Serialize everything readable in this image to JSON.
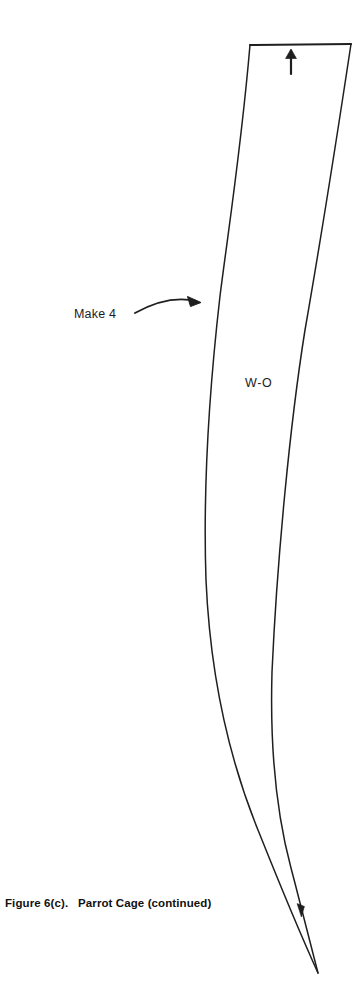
{
  "page": {
    "width": 361,
    "height": 1008,
    "background_color": "#ffffff",
    "ink_color": "#1f1f1f"
  },
  "figure": {
    "caption": "Figure 6(c).   Parrot Cage (continued)",
    "caption_bold": true,
    "piece_label": "W-O",
    "quantity_note": "Make 4",
    "grainline_icon": "up-arrow-icon",
    "direction_marker_icon": "arrowhead-icon",
    "pointer_icon": "curved-arrow-icon"
  },
  "geometry": {
    "top_edge": {
      "x1": 250,
      "y1": 45,
      "x2": 351,
      "y2": 44
    },
    "tip": {
      "x": 318,
      "y": 973
    },
    "grain_arrow": {
      "x": 291,
      "y": 62
    },
    "inner_marker": {
      "x": 300,
      "y": 910
    },
    "outer_path": "M 250 45 C 241 150 229 225 220 296 C 209 392 203 492 206 580 C 210 672 228 756 258 830 C 282 890 303 940 318 973",
    "inner_path": "M 351 44 C 338 130 320 244 305 330 C 290 424 277 560 272 672 C 270 742 276 812 291 868 C 301 906 311 946 318 973",
    "pointer_path": "M 135 313 C 152 303 173 297 197 302",
    "pointer_tip": {
      "x": 200,
      "y": 303
    }
  },
  "colors": {
    "ink": "#1f1f1f",
    "background": "#ffffff",
    "caption": "#111111"
  }
}
